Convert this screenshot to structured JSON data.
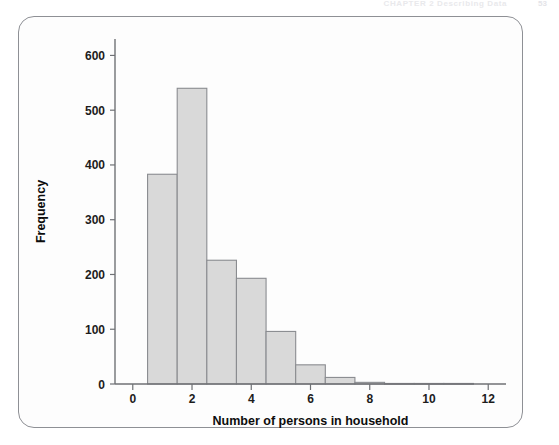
{
  "header": {
    "running_text": "CHAPTER 2  Describing Data",
    "page_number": "53"
  },
  "figure": {
    "background_color": "#fdfdfd",
    "border_color": "#8e9095",
    "bar_fill_color": "#d9d9d9",
    "bar_border_color": "#8a8c90",
    "axis_color": "#6f7175"
  },
  "chart_data": {
    "type": "bar",
    "title": "",
    "xlabel": "Number of persons in household",
    "ylabel": "Frequency",
    "categories": [
      "1",
      "2",
      "3",
      "4",
      "5",
      "6",
      "7",
      "8",
      "9",
      "10",
      "11"
    ],
    "values": [
      383,
      540,
      226,
      193,
      96,
      35,
      12,
      3,
      1,
      1,
      1
    ],
    "bin_edges": [
      0.5,
      1.5,
      2.5,
      3.5,
      4.5,
      5.5,
      6.5,
      7.5,
      8.5,
      9.5,
      10.5,
      11.5
    ],
    "bin_width": 1,
    "xlim": [
      -0.6,
      12.6
    ],
    "ylim": [
      0,
      630
    ],
    "xticks": [
      0,
      2,
      4,
      6,
      8,
      10,
      12
    ],
    "xtick_labels": [
      "0",
      "2",
      "4",
      "6",
      "8",
      "10",
      "12"
    ],
    "yticks": [
      0,
      100,
      200,
      300,
      400,
      500,
      600
    ],
    "ytick_labels": [
      "0",
      "100",
      "200",
      "300",
      "400",
      "500",
      "600"
    ],
    "grid": false,
    "legend": null
  }
}
